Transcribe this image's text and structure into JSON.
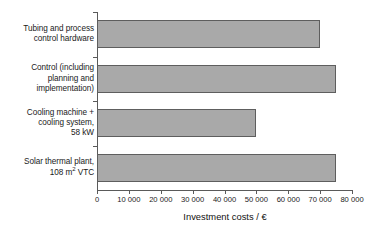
{
  "chart_data": {
    "type": "bar",
    "orientation": "horizontal",
    "title": "",
    "xlabel": "Investment costs / €",
    "ylabel": "",
    "categories": [
      "Tubing and process control hardware",
      "Control (including planning and implementation)",
      "Cooling machine + cooling system, 58 kW",
      "Solar thermal plant, 108 m² VTC"
    ],
    "category_lines": [
      [
        "Tubing and process",
        "control hardware"
      ],
      [
        "Control (including",
        "planning and",
        "implementation)"
      ],
      [
        "Cooling machine +",
        "cooling system,",
        "58 kW"
      ],
      [
        "Solar thermal plant,",
        "108 m² VTC"
      ]
    ],
    "values": [
      70000,
      75000,
      50000,
      75000
    ],
    "xlim": [
      0,
      80000
    ],
    "xticks": [
      0,
      10000,
      20000,
      30000,
      40000,
      50000,
      60000,
      70000,
      80000
    ],
    "xtick_labels": [
      "0",
      "10 000",
      "20 000",
      "30 000",
      "40 000",
      "50 000",
      "60 000",
      "70 000",
      "80 000"
    ],
    "grid": false,
    "legend": false,
    "bar_color": "#a9a9a9",
    "bar_border_color": "#5e5e5e",
    "axis_color": "#5a5a5a"
  }
}
